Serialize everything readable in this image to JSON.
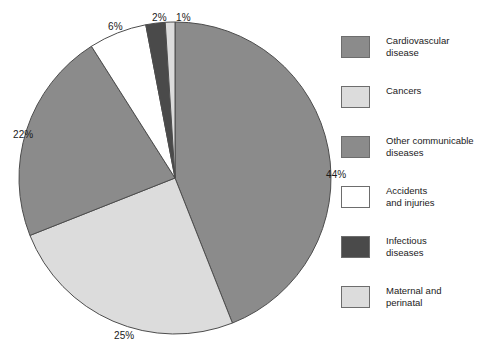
{
  "chart_data": {
    "type": "pie",
    "title": "",
    "subtitle": "",
    "xlabel": "",
    "ylabel": "",
    "legend_position": "right",
    "grid": false,
    "start_angle_deg": 0,
    "direction": "clockwise",
    "categories": [
      "Cardiovascular disease",
      "Cancers",
      "Other communicable diseases",
      "Accidents and injuries",
      "Infectious diseases",
      "Maternal and perinatal"
    ],
    "values": [
      44,
      25,
      22,
      6,
      2,
      1
    ],
    "value_labels": [
      "44%",
      "25%",
      "22%",
      "6%",
      "2%",
      "1%"
    ],
    "colors": [
      "#8b8b8b",
      "#dcdcdc",
      "#8b8b8b",
      "#ffffff",
      "#4a4a4a",
      "#dcdcdc"
    ],
    "slice_edge_color": "#4d4d4d",
    "slices": [
      {
        "label": "Cardiovascular disease",
        "value": 44,
        "value_label": "44%",
        "color": "#8b8b8b"
      },
      {
        "label": "Cancers",
        "value": 25,
        "value_label": "25%",
        "color": "#dcdcdc"
      },
      {
        "label": "Other communicable diseases",
        "value": 22,
        "value_label": "22%",
        "color": "#8b8b8b"
      },
      {
        "label": "Accidents and injuries",
        "value": 6,
        "value_label": "6%",
        "color": "#ffffff"
      },
      {
        "label": "Infectious diseases",
        "value": 2,
        "value_label": "2%",
        "color": "#4a4a4a"
      },
      {
        "label": "Maternal and perinatal",
        "value": 1,
        "value_label": "1%",
        "color": "#dcdcdc"
      }
    ]
  },
  "pie_labels": {
    "p44": "44%",
    "p25": "25%",
    "p22": "22%",
    "p6": "6%",
    "p2": "2%",
    "p1": "1%"
  },
  "legend": {
    "items": [
      {
        "line1": "Cardiovascular",
        "line2": "disease",
        "color": "#8b8b8b",
        "swatch_name": "legend-swatch-cardiovascular-disease"
      },
      {
        "line1": "Cancers",
        "line2": "",
        "color": "#dcdcdc",
        "swatch_name": "legend-swatch-cancers"
      },
      {
        "line1": "Other communicable",
        "line2": "diseases",
        "color": "#8b8b8b",
        "swatch_name": "legend-swatch-other-communicable-diseases"
      },
      {
        "line1": "Accidents",
        "line2": "and injuries",
        "color": "#ffffff",
        "swatch_name": "legend-swatch-accidents-and-injuries"
      },
      {
        "line1": "Infectious",
        "line2": "diseases",
        "color": "#4a4a4a",
        "swatch_name": "legend-swatch-infectious-diseases"
      },
      {
        "line1": "Maternal and",
        "line2": "perinatal",
        "color": "#dcdcdc",
        "swatch_name": "legend-swatch-maternal-and-perinatal"
      }
    ]
  }
}
